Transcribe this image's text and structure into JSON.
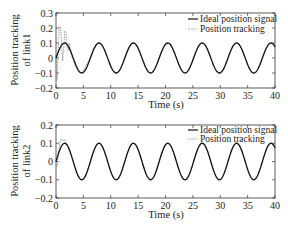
{
  "chart_data": [
    {
      "type": "line",
      "panel": "top",
      "title": "",
      "xlabel": "Time (s)",
      "ylabel_line1": "Position tracking",
      "ylabel_line2": "of link1",
      "xlim": [
        0,
        40
      ],
      "ylim": [
        -0.2,
        0.3
      ],
      "xticks": [
        0,
        5,
        10,
        15,
        20,
        25,
        30,
        35,
        40
      ],
      "yticks": [
        -0.2,
        -0.1,
        0,
        0.1,
        0.2,
        0.3
      ],
      "xtick_labels": [
        "0",
        "5",
        "10",
        "15",
        "20",
        "25",
        "30",
        "35",
        "40"
      ],
      "ytick_labels": [
        "−0.2",
        "−0.1",
        "0",
        "0.1",
        "0.2",
        "0.3"
      ],
      "grid": false,
      "legend_position": "upper right",
      "series": [
        {
          "name": "Ideal position signal",
          "style": "solid",
          "color": "#111111",
          "formula": "0.1*sin(t)",
          "x": [
            0,
            1.57,
            3.14,
            4.71,
            6.28,
            7.85,
            9.42,
            11.0,
            12.57,
            14.14,
            15.71,
            17.28,
            18.85,
            20.42,
            21.99,
            23.56,
            25.13,
            26.7,
            28.27,
            29.85,
            31.42,
            32.99,
            34.56,
            36.13,
            37.7,
            39.27,
            40
          ],
          "values": [
            0,
            0.1,
            0,
            -0.1,
            0,
            0.1,
            0,
            -0.1,
            0,
            0.1,
            0,
            -0.1,
            0,
            0.1,
            0,
            -0.1,
            0,
            0.1,
            0,
            -0.1,
            0,
            0.1,
            0,
            -0.1,
            0,
            0.1,
            0.075
          ]
        },
        {
          "name": "Position tracking",
          "style": "dashed",
          "color": "#888888",
          "x": [
            0,
            0.2,
            0.4,
            0.6,
            0.8,
            1.0,
            1.2,
            1.4,
            1.6,
            1.8,
            2.0,
            2.2,
            2.4,
            2.6,
            2.8,
            3.0,
            3.5,
            4.0,
            4.71,
            6.28,
            7.85,
            40
          ],
          "values": [
            0,
            -0.15,
            0.05,
            0.2,
            0.21,
            0.12,
            -0.02,
            0.05,
            0.18,
            0.17,
            0.08,
            0.05,
            0.1,
            0.07,
            0.02,
            0.0,
            -0.05,
            -0.09,
            -0.1,
            0,
            0.1,
            0.075
          ],
          "note": "Large transient oscillation during 0-3 s, then converges to ideal signal"
        }
      ]
    },
    {
      "type": "line",
      "panel": "bottom",
      "title": "",
      "xlabel": "Time (s)",
      "ylabel_line1": "Position tracking",
      "ylabel_line2": "of link2",
      "xlim": [
        0,
        40
      ],
      "ylim": [
        -0.2,
        0.2
      ],
      "xticks": [
        0,
        5,
        10,
        15,
        20,
        25,
        30,
        35,
        40
      ],
      "yticks": [
        -0.2,
        -0.1,
        0,
        0.1,
        0.2
      ],
      "xtick_labels": [
        "0",
        "5",
        "10",
        "15",
        "20",
        "25",
        "30",
        "35",
        "40"
      ],
      "ytick_labels": [
        "−0.2",
        "−0.1",
        "0",
        "0.1",
        "0.2"
      ],
      "grid": false,
      "legend_position": "upper right",
      "series": [
        {
          "name": "Ideal position signal",
          "style": "solid",
          "color": "#111111",
          "formula": "0.1*sin(t)",
          "x": [
            0,
            1.57,
            3.14,
            4.71,
            6.28,
            7.85,
            9.42,
            11.0,
            12.57,
            14.14,
            15.71,
            17.28,
            18.85,
            20.42,
            21.99,
            23.56,
            25.13,
            26.7,
            28.27,
            29.85,
            31.42,
            32.99,
            34.56,
            36.13,
            37.7,
            39.27,
            40
          ],
          "values": [
            0,
            0.1,
            0,
            -0.1,
            0,
            0.1,
            0,
            -0.1,
            0,
            0.1,
            0,
            -0.1,
            0,
            0.1,
            0,
            -0.1,
            0,
            0.1,
            0,
            -0.1,
            0,
            0.1,
            0,
            -0.1,
            0,
            0.1,
            0.075
          ]
        },
        {
          "name": "Position tracking",
          "style": "dashed",
          "color": "#888888",
          "x": [
            0,
            0.2,
            0.4,
            0.7,
            1.0,
            1.3,
            1.6,
            2.0,
            2.5,
            3.14,
            4.71,
            40
          ],
          "values": [
            0,
            -0.03,
            0.03,
            0.1,
            0.125,
            0.11,
            0.12,
            0.095,
            0.06,
            0.0,
            -0.1,
            0.075
          ],
          "note": "Small transient during 0-2 s, then converges to ideal signal"
        }
      ]
    }
  ],
  "legend": {
    "ideal_label": "Ideal position signal",
    "tracking_label": "Position tracking"
  }
}
